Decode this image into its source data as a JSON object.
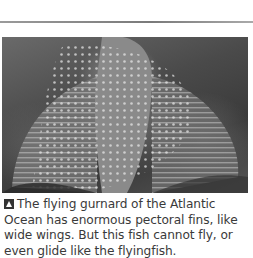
{
  "caption": {
    "icon": "triangle-pointer-icon",
    "text": "The flying gurnard of the Atlantic Ocean has enormous pectoral fins, like wide wings. But this fish cannot fly, or even glide like the flyingfish."
  },
  "photo": {
    "subject": "flying gurnard fish with spread pectoral fins"
  }
}
